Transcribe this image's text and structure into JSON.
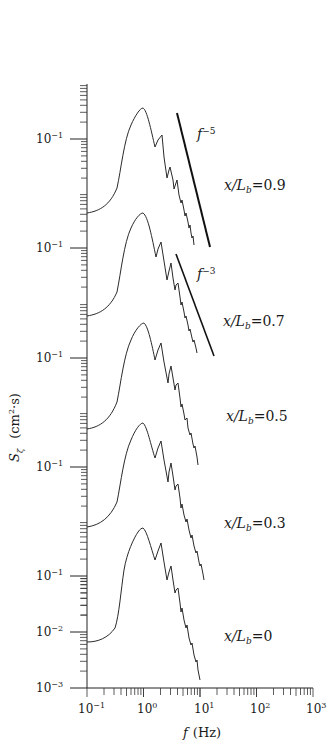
{
  "chart_data": {
    "type": "line",
    "title": "",
    "xlabel": "f (Hz)",
    "ylabel": "S_ζ (cm²·s)",
    "x_scale": "log",
    "y_scale": "log (stacked, offset panels)",
    "xlim": [
      0.1,
      1000
    ],
    "x_ticks": [
      "10⁻¹",
      "10⁰",
      "10¹",
      "10²",
      "10³"
    ],
    "y_tick_labels": [
      "10⁻¹",
      "10⁻¹",
      "10⁻¹",
      "10⁻¹",
      "10⁻¹",
      "10⁻²",
      "10⁻³"
    ],
    "bottom_panel_ylim": [
      0.001,
      0.3
    ],
    "grid": false,
    "legend": "none (inline labels right of each curve)",
    "reference_lines": [
      {
        "label": "f⁻⁵",
        "slope": -5,
        "applies_to": "x/L_b=0.9"
      },
      {
        "label": "f⁻³",
        "slope": -3,
        "applies_to": "x/L_b=0.7"
      }
    ],
    "series": [
      {
        "name": "x/L_b=0.9",
        "offset_panel": 5,
        "f": [
          0.1,
          0.3,
          0.5,
          0.9,
          1.4,
          1.6,
          2.0,
          2.3,
          2.6,
          3.0,
          4.0,
          6.0,
          9.0
        ],
        "peak_f": 0.9,
        "peak_S": 0.25,
        "low_f_S": 0.02
      },
      {
        "name": "x/L_b=0.7",
        "offset_panel": 4,
        "f": [
          0.1,
          0.3,
          0.5,
          0.9,
          1.4,
          1.6,
          2.0,
          2.3,
          2.6,
          3.0,
          4.0,
          6.0,
          8.0
        ],
        "peak_f": 0.9,
        "peak_S": 0.22,
        "low_f_S": 0.02
      },
      {
        "name": "x/L_b=0.5",
        "offset_panel": 3,
        "f": [
          0.1,
          0.3,
          0.5,
          0.9,
          1.4,
          1.6,
          2.0,
          2.3,
          2.6,
          3.0,
          4.0,
          6.0,
          8.5
        ],
        "peak_f": 0.95,
        "peak_S": 0.22,
        "low_f_S": 0.02
      },
      {
        "name": "x/L_b=0.3",
        "offset_panel": 2,
        "f": [
          0.1,
          0.3,
          0.5,
          0.9,
          1.4,
          1.6,
          2.0,
          2.3,
          2.6,
          3.0,
          4.0,
          6.0,
          10.0
        ],
        "peak_f": 0.9,
        "peak_S": 0.25,
        "low_f_S": 0.02
      },
      {
        "name": "x/L_b=0",
        "offset_panel": 1,
        "f": [
          0.1,
          0.3,
          0.5,
          0.9,
          1.4,
          1.6,
          2.0,
          2.3,
          2.6,
          3.0,
          4.0,
          6.0,
          9.5
        ],
        "peak_f": 0.9,
        "peak_S": 0.25,
        "low_f_S": 0.007
      }
    ]
  },
  "labels": {
    "x_ticks": [
      "10",
      "10",
      "10",
      "10",
      "10"
    ],
    "x_exps": [
      "−1",
      "0",
      "1",
      "2",
      "3"
    ],
    "y_base": "10",
    "y_exps": [
      "−1",
      "−1",
      "−1",
      "−1",
      "−1",
      "−2",
      "−3"
    ],
    "series": [
      "x/L",
      "x/L",
      "x/L",
      "x/L",
      "x/L"
    ],
    "series_sub": "b",
    "series_vals": [
      "=0.9",
      "=0.7",
      "=0.5",
      "=0.3",
      "=0"
    ],
    "ref_f": "f",
    "ref_exp5": "−5",
    "ref_exp3": "−3",
    "xlabel_f": "f",
    "xlabel_unit": "(Hz)",
    "ylabel_S": "S",
    "ylabel_sub": "ζ",
    "ylabel_unit": "(cm",
    "ylabel_sq": "2",
    "ylabel_end": "·s)"
  }
}
